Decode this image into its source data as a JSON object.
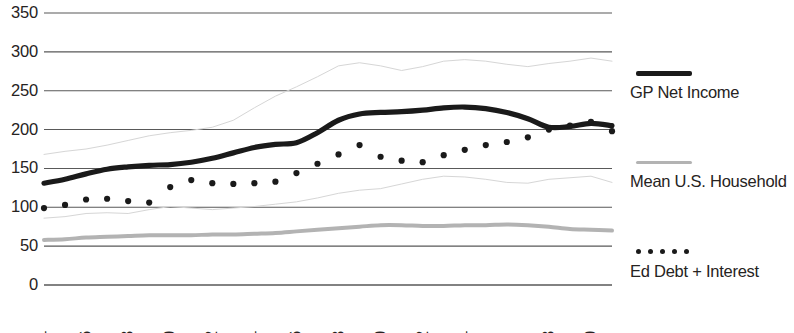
{
  "chart_data": {
    "type": "line",
    "title": "",
    "xlabel": "",
    "ylabel": "",
    "grid": true,
    "legend_position": "right",
    "ylim": [
      0,
      350
    ],
    "yticks": [
      0,
      50,
      100,
      150,
      200,
      250,
      300,
      350
    ],
    "ytick_labels": [
      "0",
      "50",
      "100",
      "150",
      "200",
      "250",
      "300",
      "350"
    ],
    "x": [
      1984,
      1985,
      1986,
      1987,
      1988,
      1989,
      1990,
      1991,
      1992,
      1993,
      1994,
      1995,
      1996,
      1997,
      1998,
      1999,
      2000,
      2001,
      2002,
      2003,
      2004,
      2005,
      2006,
      2007,
      2008,
      2009,
      2010,
      2011
    ],
    "xtick_labels": [
      "1984",
      "1986",
      "1988",
      "1990",
      "1992",
      "1994",
      "1996",
      "1998",
      "2000",
      "2002",
      "2004",
      "2008",
      "2010"
    ],
    "xtick_values": [
      1984,
      1986,
      1988,
      1990,
      1992,
      1994,
      1996,
      1998,
      2000,
      2002,
      2004,
      2008,
      2010
    ],
    "series": [
      {
        "name": "GP Net Income",
        "style": "thick-line",
        "color": "#1a1a1a",
        "in_legend": true,
        "values": [
          131,
          136,
          143,
          149,
          152,
          154,
          155,
          158,
          163,
          170,
          177,
          181,
          183,
          196,
          212,
          220,
          222,
          223,
          225,
          228,
          229,
          227,
          222,
          214,
          203,
          204,
          208,
          205
        ]
      },
      {
        "name": "Mean U.S. Household",
        "style": "thin-gray-line",
        "color": "#b3b3b3",
        "in_legend": true,
        "values": [
          58,
          59,
          61,
          62,
          63,
          64,
          64,
          64,
          65,
          65,
          66,
          67,
          69,
          71,
          73,
          75,
          77,
          77,
          76,
          76,
          77,
          77,
          78,
          77,
          75,
          72,
          71,
          70
        ]
      },
      {
        "name": "Ed Debt + Interest",
        "style": "dotted",
        "color": "#1a1a1a",
        "in_legend": true,
        "values": [
          99,
          103,
          110,
          111,
          108,
          106,
          126,
          135,
          131,
          130,
          131,
          133,
          144,
          156,
          168,
          180,
          165,
          160,
          158,
          167,
          174,
          180,
          184,
          190,
          200,
          205,
          210,
          198
        ]
      },
      {
        "name": "",
        "style": "faint-line-upper",
        "color": "#d6d6d6",
        "in_legend": false,
        "values": [
          168,
          172,
          175,
          180,
          186,
          192,
          196,
          199,
          203,
          212,
          228,
          243,
          255,
          268,
          282,
          286,
          282,
          276,
          281,
          288,
          290,
          288,
          284,
          281,
          285,
          288,
          292,
          288
        ]
      },
      {
        "name": "",
        "style": "faint-line-lower",
        "color": "#d6d6d6",
        "in_legend": false,
        "values": [
          86,
          88,
          92,
          93,
          92,
          97,
          101,
          99,
          97,
          99,
          101,
          104,
          107,
          112,
          118,
          122,
          124,
          130,
          136,
          140,
          139,
          136,
          132,
          131,
          136,
          138,
          140,
          132
        ]
      }
    ]
  },
  "legend": {
    "entries": [
      {
        "label": "GP Net Income",
        "swatch": "thick-black-line",
        "color": "#1a1a1a"
      },
      {
        "label": "Mean U.S. Household",
        "swatch": "thin-gray-line",
        "color": "#b3b3b3"
      },
      {
        "label": "Ed Debt + Interest",
        "swatch": "black-dotted-line",
        "color": "#1a1a1a"
      }
    ]
  },
  "colors": {
    "gridline": "#595959",
    "axis_text": "#262322",
    "background": "#ffffff"
  }
}
